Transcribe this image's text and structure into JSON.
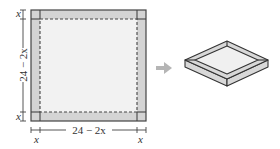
{
  "figure": {
    "flat_sheet": {
      "side_label": "24 − 2x",
      "bottom_label": "24 − 2x",
      "corner_label": "x",
      "colors": {
        "outline": "#444444",
        "corner_fill": "#d4d4d4",
        "inner_fill": "#f2f2f2"
      }
    },
    "arrow": {
      "color": "#b5b5b5"
    },
    "box": {
      "colors": {
        "outline": "#333333",
        "side_fill": "#d8d8d8",
        "top_fill": "#f0f0f0"
      }
    }
  }
}
